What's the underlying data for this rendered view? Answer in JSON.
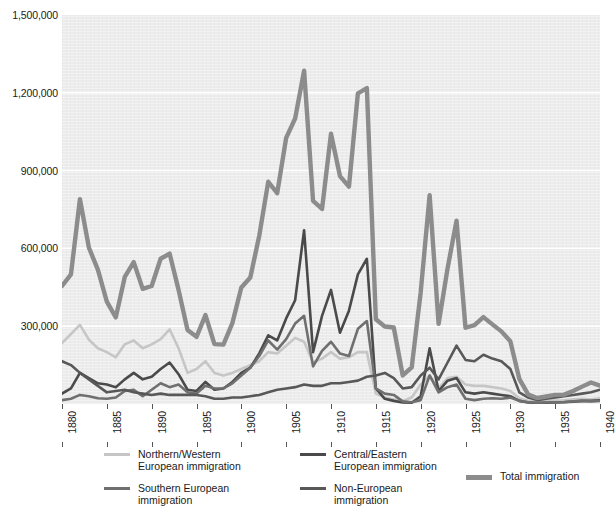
{
  "chart_data": {
    "type": "line",
    "title": "",
    "xlabel": "",
    "ylabel": "",
    "xlim": [
      1880,
      1940
    ],
    "ylim": [
      0,
      1500000
    ],
    "grid": true,
    "legend_position": "bottom",
    "y_ticks": [
      0,
      300000,
      600000,
      900000,
      1200000,
      1500000
    ],
    "y_tick_labels": [
      "",
      "300,000",
      "600,000",
      "900,000",
      "1,200,000",
      "1,500,000"
    ],
    "x_ticks": [
      1880,
      1885,
      1890,
      1895,
      1900,
      1905,
      1910,
      1915,
      1920,
      1925,
      1930,
      1935,
      1940
    ],
    "x_tick_labels": [
      "1880",
      "1885",
      "1890",
      "1895",
      "1900",
      "1905",
      "1910",
      "1915",
      "1920",
      "1925",
      "1930",
      "1935",
      "1940"
    ],
    "x": [
      1880,
      1881,
      1882,
      1883,
      1884,
      1885,
      1886,
      1887,
      1888,
      1889,
      1890,
      1891,
      1892,
      1893,
      1894,
      1895,
      1896,
      1897,
      1898,
      1899,
      1900,
      1901,
      1902,
      1903,
      1904,
      1905,
      1906,
      1907,
      1908,
      1909,
      1910,
      1911,
      1912,
      1913,
      1914,
      1915,
      1916,
      1917,
      1918,
      1919,
      1920,
      1921,
      1922,
      1923,
      1924,
      1925,
      1926,
      1927,
      1928,
      1929,
      1930,
      1931,
      1932,
      1933,
      1934,
      1935,
      1936,
      1937,
      1938,
      1939,
      1940
    ],
    "series": [
      {
        "name": "Northern/Western European immigration",
        "color": "#c6c6c6",
        "width": 2.6,
        "values": [
          235000,
          270000,
          305000,
          248000,
          215000,
          200000,
          180000,
          230000,
          245000,
          215000,
          230000,
          250000,
          288000,
          215000,
          120000,
          135000,
          165000,
          120000,
          110000,
          120000,
          135000,
          150000,
          165000,
          200000,
          195000,
          225000,
          255000,
          240000,
          160000,
          175000,
          200000,
          175000,
          180000,
          200000,
          200000,
          40000,
          25000,
          18000,
          12000,
          25000,
          75000,
          110000,
          60000,
          100000,
          105000,
          75000,
          70000,
          70000,
          65000,
          60000,
          50000,
          22000,
          12000,
          10000,
          12000,
          13000,
          14000,
          18000,
          20000,
          18000,
          22000
        ]
      },
      {
        "name": "Central/Eastern European immigration",
        "color": "#4a4a4a",
        "width": 2.6,
        "values": [
          40000,
          60000,
          120000,
          100000,
          80000,
          75000,
          65000,
          95000,
          120000,
          95000,
          105000,
          135000,
          160000,
          115000,
          55000,
          50000,
          85000,
          55000,
          60000,
          85000,
          120000,
          140000,
          195000,
          265000,
          245000,
          330000,
          400000,
          670000,
          200000,
          340000,
          440000,
          275000,
          360000,
          500000,
          560000,
          60000,
          20000,
          12000,
          6000,
          5000,
          30000,
          215000,
          50000,
          90000,
          100000,
          45000,
          40000,
          45000,
          40000,
          35000,
          30000,
          12000,
          6000,
          4000,
          5000,
          6000,
          7000,
          9000,
          12000,
          12000,
          14000
        ]
      },
      {
        "name": "Southern European immigration",
        "color": "#6f6f6f",
        "width": 2.6,
        "values": [
          15000,
          20000,
          35000,
          30000,
          22000,
          20000,
          25000,
          50000,
          55000,
          30000,
          55000,
          80000,
          65000,
          75000,
          45000,
          40000,
          70000,
          60000,
          60000,
          80000,
          110000,
          140000,
          185000,
          245000,
          210000,
          250000,
          310000,
          340000,
          145000,
          205000,
          240000,
          195000,
          185000,
          290000,
          320000,
          60000,
          40000,
          35000,
          10000,
          7000,
          15000,
          110000,
          45000,
          65000,
          75000,
          20000,
          15000,
          20000,
          22000,
          20000,
          25000,
          12000,
          7000,
          5000,
          6000,
          7000,
          8000,
          10000,
          12000,
          10000,
          12000
        ]
      },
      {
        "name": "Non-European immigration",
        "color": "#585858",
        "width": 2.6,
        "values": [
          165000,
          150000,
          120000,
          95000,
          70000,
          45000,
          50000,
          55000,
          45000,
          40000,
          35000,
          40000,
          35000,
          35000,
          35000,
          35000,
          30000,
          20000,
          20000,
          25000,
          25000,
          30000,
          35000,
          45000,
          55000,
          60000,
          65000,
          75000,
          70000,
          70000,
          80000,
          80000,
          85000,
          90000,
          105000,
          110000,
          120000,
          100000,
          60000,
          65000,
          110000,
          140000,
          95000,
          160000,
          225000,
          170000,
          165000,
          190000,
          175000,
          165000,
          135000,
          45000,
          25000,
          15000,
          20000,
          25000,
          30000,
          35000,
          40000,
          45000,
          55000
        ]
      },
      {
        "name": "Total immigration",
        "color": "#8c8c8c",
        "width": 4.4,
        "values": [
          455000,
          500000,
          790000,
          603000,
          518000,
          395000,
          334000,
          490000,
          547000,
          444000,
          455000,
          560000,
          580000,
          440000,
          285000,
          259000,
          343000,
          231000,
          229000,
          312000,
          449000,
          488000,
          649000,
          857000,
          813000,
          1026000,
          1101000,
          1285000,
          783000,
          752000,
          1042000,
          879000,
          838000,
          1198000,
          1218000,
          327000,
          299000,
          295000,
          110000,
          141000,
          430000,
          805000,
          309000,
          523000,
          707000,
          294000,
          304000,
          335000,
          307000,
          280000,
          242000,
          97000,
          36000,
          23000,
          29000,
          35000,
          36000,
          50000,
          67000,
          83000,
          71000
        ]
      }
    ]
  },
  "legend": {
    "items": [
      {
        "id": "northern-western",
        "label": "Northern/Western\nEuropean immigration",
        "color": "#c6c6c6",
        "thick": false
      },
      {
        "id": "central-eastern",
        "label": "Central/Eastern\nEuropean immigration",
        "color": "#4a4a4a",
        "thick": false
      },
      {
        "id": "southern",
        "label": "Southern European\nimmigration",
        "color": "#6f6f6f",
        "thick": false
      },
      {
        "id": "non-european",
        "label": "Non-European\nimmigration",
        "color": "#585858",
        "thick": false
      },
      {
        "id": "total",
        "label": "Total immigration",
        "color": "#8c8c8c",
        "thick": true
      }
    ]
  }
}
